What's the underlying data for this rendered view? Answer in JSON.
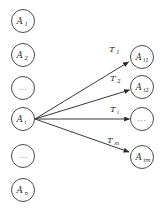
{
  "diagram": {
    "background_color": "#ffffff",
    "node_stroke_color": "#4a4a4a",
    "edge_color": "#3a3a3a",
    "text_color": "#2b2b2b",
    "left_column": {
      "name": "activity-set-column",
      "nodes": [
        {
          "id": "A1",
          "base": "A",
          "sub": "1",
          "is_ellipsis": false,
          "ellipsis": "",
          "cx": 23,
          "cy": 21,
          "r": 11.5
        },
        {
          "id": "A2",
          "base": "A",
          "sub": "2",
          "is_ellipsis": false,
          "ellipsis": "",
          "cx": 23,
          "cy": 55,
          "r": 11.5
        },
        {
          "id": "dots-top",
          "base": "",
          "sub": "",
          "is_ellipsis": true,
          "ellipsis": "...",
          "cx": 23,
          "cy": 88,
          "r": 11.5
        },
        {
          "id": "Ai",
          "base": "A",
          "sub": "i",
          "is_ellipsis": false,
          "ellipsis": "",
          "cx": 23,
          "cy": 119,
          "r": 11.5
        },
        {
          "id": "dots-bot",
          "base": "",
          "sub": "",
          "is_ellipsis": true,
          "ellipsis": "...",
          "cx": 23,
          "cy": 156,
          "r": 11.5
        },
        {
          "id": "An",
          "base": "A",
          "sub": "n",
          "is_ellipsis": false,
          "ellipsis": "",
          "cx": 23,
          "cy": 190,
          "r": 11.5
        }
      ]
    },
    "right_column": {
      "name": "sub-activity-column",
      "nodes": [
        {
          "id": "Ai1",
          "base": "A",
          "sub": "i1",
          "is_ellipsis": false,
          "ellipsis": "",
          "cx": 142,
          "cy": 57,
          "r": 11.5
        },
        {
          "id": "Ai2",
          "base": "A",
          "sub": "i2",
          "is_ellipsis": false,
          "ellipsis": "",
          "cx": 142,
          "cy": 87,
          "r": 11.5
        },
        {
          "id": "dots-mid",
          "base": "",
          "sub": "",
          "is_ellipsis": true,
          "ellipsis": "...",
          "cx": 142,
          "cy": 119,
          "r": 11.5
        },
        {
          "id": "Aim",
          "base": "A",
          "sub": "im",
          "is_ellipsis": false,
          "ellipsis": "",
          "cx": 142,
          "cy": 157,
          "r": 11.5
        }
      ]
    },
    "edges": [
      {
        "id": "edge-T1",
        "from": "Ai",
        "to": "Ai1",
        "base": "T",
        "sub": "1",
        "x1": 35,
        "y1": 119,
        "x2": 128.5,
        "y2": 62,
        "label_x": 112,
        "label_y": 52
      },
      {
        "id": "edge-T2",
        "from": "Ai",
        "to": "Ai2",
        "base": "T",
        "sub": "2",
        "x1": 35,
        "y1": 119,
        "x2": 129.5,
        "y2": 90,
        "label_x": 113,
        "label_y": 81
      },
      {
        "id": "edge-Ti",
        "from": "Ai",
        "to": "dots-mid",
        "base": "T",
        "sub": "i",
        "x1": 35,
        "y1": 119,
        "x2": 129.5,
        "y2": 119,
        "label_x": 113,
        "label_y": 112
      },
      {
        "id": "edge-Tm",
        "from": "Ai",
        "to": "Aim",
        "base": "T",
        "sub": "m",
        "x1": 35,
        "y1": 119,
        "x2": 129,
        "y2": 152,
        "label_x": 110,
        "label_y": 143
      }
    ]
  }
}
